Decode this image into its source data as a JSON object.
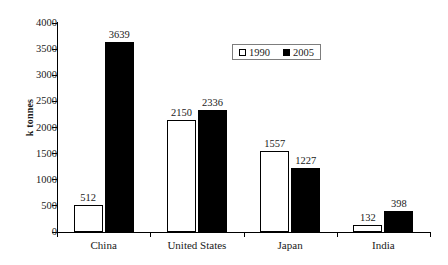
{
  "chart_data": {
    "type": "bar",
    "title": "",
    "subtitle": "",
    "xlabel": "",
    "ylabel": "k tonnes",
    "ylim": [
      0,
      4000
    ],
    "ytick_step": 500,
    "yticks": [
      0,
      500,
      1000,
      1500,
      2000,
      2500,
      3000,
      3500,
      4000
    ],
    "ytick_labels": [
      "0",
      "500",
      "1000",
      "1500",
      "2000",
      "2500",
      "3000",
      "3500",
      "4000"
    ],
    "categories": [
      "China",
      "United States",
      "Japan",
      "India"
    ],
    "series": [
      {
        "name": "1990",
        "values": [
          512,
          2150,
          1557,
          132
        ],
        "color": "#ffffff",
        "edge_color": "#000000"
      },
      {
        "name": "2005",
        "values": [
          3639,
          2336,
          1227,
          398
        ],
        "color": "#000000",
        "edge_color": "#000000"
      }
    ],
    "value_labels": {
      "show": true,
      "China": [
        "512",
        "3639"
      ],
      "United States": [
        "2150",
        "2336"
      ],
      "Japan": [
        "1557",
        "1227"
      ],
      "India": [
        "132",
        "398"
      ]
    },
    "grid": false,
    "legend": {
      "position": "top-center-right",
      "boxed": true,
      "entries": [
        {
          "label": "1990",
          "marker": "open-square"
        },
        {
          "label": "2005",
          "marker": "filled-square"
        }
      ]
    }
  }
}
